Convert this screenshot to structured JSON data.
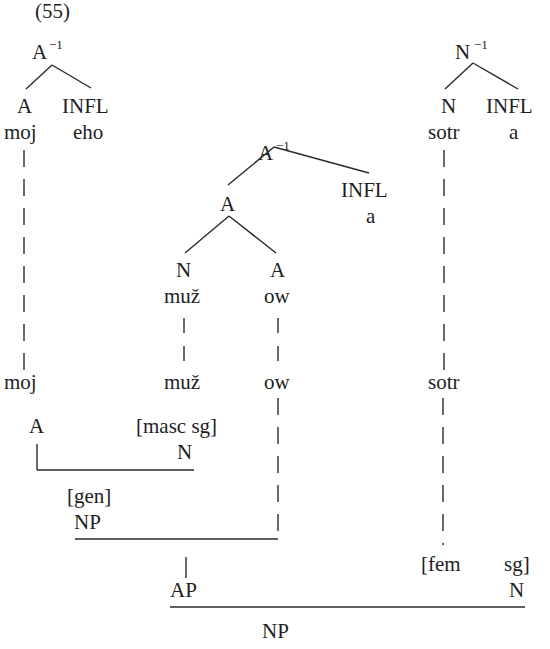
{
  "example_number": "(55)",
  "trees": {
    "moj_tree": {
      "root": {
        "label": "A",
        "superscript": "−1"
      },
      "children": [
        {
          "label": "A",
          "form": "moj"
        },
        {
          "label": "INFL",
          "form": "eho"
        }
      ]
    },
    "muz_tree": {
      "root": {
        "label": "A",
        "superscript": "−1"
      },
      "inner": {
        "label": "A"
      },
      "children": [
        {
          "label": "N",
          "form": "muž"
        },
        {
          "label": "A",
          "form": "ow"
        }
      ],
      "infl": {
        "label": "INFL",
        "form": "a"
      }
    },
    "sotr_tree": {
      "root": {
        "label": "N",
        "superscript": "−1"
      },
      "children": [
        {
          "label": "N",
          "form": "sotr"
        },
        {
          "label": "INFL",
          "form": "a"
        }
      ]
    }
  },
  "stems": {
    "moj": "moj",
    "muz": "muž",
    "ow": "ow",
    "sotr": "sotr"
  },
  "lower_structure": {
    "moj_cat": "A",
    "muz_features": "[masc sg]",
    "muz_cat": "N",
    "gen_feature": "[gen]",
    "gen_np": "NP",
    "ap": "AP",
    "sotr_feature_fem": "[fem",
    "sotr_feature_sg": "sg]",
    "sotr_cat": "N",
    "final_np": "NP"
  }
}
